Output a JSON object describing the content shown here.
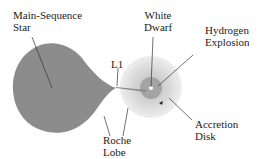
{
  "diagram": {
    "labels": {
      "main_sequence_star": "Main-Sequence\nStar",
      "white_dwarf": "White\nDwarf",
      "hydrogen_explosion": "Hydrogen\nExplosion",
      "l1": "L1",
      "accretion_disk": "Accretion\nDisk",
      "roche_lobe": "Roche\nLobe"
    },
    "colors": {
      "star": "#8c8c8c",
      "disk_outer": "#e4e4e4",
      "disk_mid": "#cfcfcf",
      "disk_inner": "#9a9a9a",
      "stream": "#8a8a8a",
      "leader": "#333333"
    }
  }
}
